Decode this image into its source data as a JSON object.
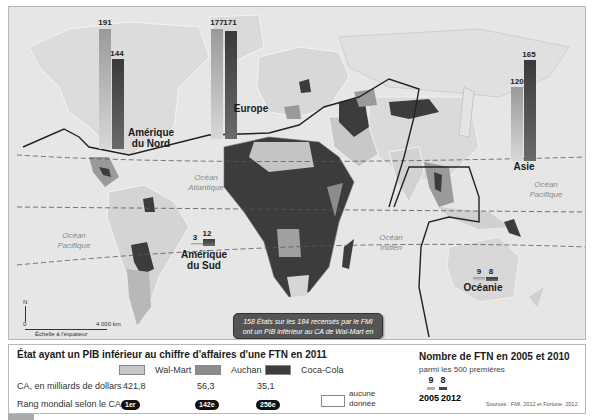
{
  "map": {
    "oceans": [
      {
        "id": "atlantique",
        "label": "Océan\nAtlantique"
      },
      {
        "id": "pacifique_ouest",
        "label": "Océan\nPacifique"
      },
      {
        "id": "pacifique_est",
        "label": "Océan\nPacifique"
      },
      {
        "id": "indien",
        "label": "Océan\nIndien"
      }
    ],
    "regions": [
      {
        "name": "Amérique du Nord",
        "line1": "Amérique",
        "line2": "du Nord",
        "ftn_2005": "191",
        "ftn_2012": "144"
      },
      {
        "name": "Europe",
        "line1": "Europe",
        "line2": "",
        "ftn_2005": "177",
        "ftn_2012": "171"
      },
      {
        "name": "Asie",
        "line1": "Asie",
        "line2": "",
        "ftn_2005": "120",
        "ftn_2012": "165"
      },
      {
        "name": "Amérique du Sud",
        "line1": "Amérique",
        "line2": "du Sud",
        "ftn_2005": "3",
        "ftn_2012": "12"
      },
      {
        "name": "Océanie",
        "line1": "Océanie",
        "line2": "",
        "ftn_2005": "9",
        "ftn_2012": "8"
      }
    ],
    "callout": {
      "line1": "158 États sur les 184 recensés par le FMI",
      "line2": "ont un PIB inférieur au CA de Wal-Mart en 2010"
    },
    "scale": {
      "north": "N",
      "zero": "0",
      "distance": "4 000 km",
      "caption": "Échelle à l'équateur"
    }
  },
  "legend": {
    "title": "État ayant un PIB inférieur au chiffre d'affaires d'une FTN en 2011",
    "row_ca_label": "CA, en milliards de dollars",
    "row_rank_label": "Rang mondial selon le CA",
    "companies": [
      {
        "name": "Wal-Mart",
        "ca": "421,8",
        "rank": "1er",
        "color": "#c8c8c8"
      },
      {
        "name": "Auchan",
        "ca": "56,3",
        "rank": "142e",
        "color": "#8c8c8c"
      },
      {
        "name": "Coca-Cola",
        "ca": "35,1",
        "rank": "256e",
        "color": "#3c3c3c"
      }
    ],
    "no_data": {
      "line1": "aucune",
      "line2": "donnée"
    },
    "ftn": {
      "title": "Nombre de FTN en 2005 et 2010",
      "subtitle": "parmi les 500 premières",
      "example_2005": "9",
      "example_2012": "8",
      "year_2005": "2005",
      "year_2012": "2012"
    },
    "sources": "Sources : FMI, 2012 et Fortune, 2012."
  }
}
